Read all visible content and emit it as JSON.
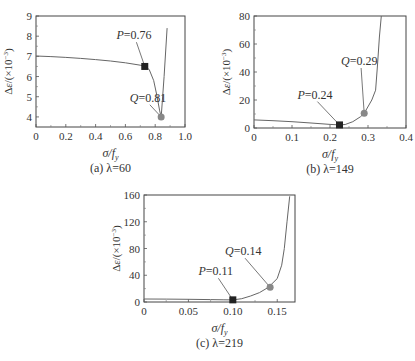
{
  "figure": {
    "panels": [
      "a",
      "b",
      "c"
    ]
  },
  "chart_data": [
    {
      "id": "a",
      "type": "line",
      "caption": "(a) λ=60",
      "xlabel": "σ/f_y",
      "ylabel": "Δε/(×10⁻³)",
      "xlim": [
        0,
        1.0
      ],
      "ylim": [
        3.5,
        9
      ],
      "xticks": [
        0,
        0.2,
        0.4,
        0.6,
        0.8,
        1.0
      ],
      "xticklabels": [
        "0",
        "0.2",
        "0.4",
        "0.6",
        "0.8",
        "1.0"
      ],
      "yticks": [
        4,
        5,
        6,
        7,
        8,
        9
      ],
      "yticklabels": [
        "4",
        "5",
        "6",
        "7",
        "8",
        "9"
      ],
      "grid": false,
      "frame": {
        "left": 36,
        "top": 16,
        "right": 185,
        "bottom": 127
      },
      "series": [
        {
          "name": "curve",
          "x": [
            0,
            0.1,
            0.2,
            0.3,
            0.4,
            0.5,
            0.6,
            0.7,
            0.73,
            0.76,
            0.79,
            0.81,
            0.83,
            0.84,
            0.86,
            0.88
          ],
          "y": [
            7.02,
            6.99,
            6.95,
            6.9,
            6.84,
            6.77,
            6.68,
            6.56,
            6.5,
            6.35,
            5.8,
            5.1,
            4.3,
            4.0,
            6.0,
            8.4
          ]
        }
      ],
      "markers": [
        {
          "label": "P=0.76",
          "prefix": "P",
          "value": "=0.76",
          "x": 0.73,
          "y": 6.5,
          "shape": "square",
          "color": "#222222",
          "label_x": 0.58,
          "label_y": 7.85
        },
        {
          "label": "Q=0.81",
          "prefix": "Q",
          "value": "=0.81",
          "x": 0.84,
          "y": 4.0,
          "shape": "circle",
          "color": "#888888",
          "label_x": 0.67,
          "label_y": 4.75
        }
      ]
    },
    {
      "id": "b",
      "type": "line",
      "caption": "(b) λ=149",
      "xlabel": "σ/f_y",
      "ylabel": "Δε/(×10⁻³)",
      "xlim": [
        0,
        0.4
      ],
      "ylim": [
        0,
        80
      ],
      "xticks": [
        0,
        0.1,
        0.2,
        0.3,
        0.4
      ],
      "xticklabels": [
        "0",
        "0.1",
        "0.2",
        "0.3",
        "0.4"
      ],
      "yticks": [
        0,
        20,
        40,
        60,
        80
      ],
      "yticklabels": [
        "0",
        "20",
        "40",
        "60",
        "80"
      ],
      "grid": false,
      "frame": {
        "left": 254,
        "top": 16,
        "right": 406,
        "bottom": 128
      },
      "series": [
        {
          "name": "curve",
          "x": [
            0,
            0.05,
            0.1,
            0.15,
            0.2,
            0.225,
            0.24,
            0.26,
            0.28,
            0.29,
            0.31,
            0.32,
            0.325,
            0.33,
            0.335
          ],
          "y": [
            5.8,
            5.2,
            4.5,
            3.6,
            2.6,
            2.2,
            2.5,
            4.5,
            8.0,
            10.5,
            20,
            27,
            45,
            65,
            80
          ]
        }
      ],
      "markers": [
        {
          "label": "P=0.24",
          "prefix": "P",
          "value": "=0.24",
          "x": 0.225,
          "y": 2.2,
          "shape": "square",
          "color": "#222222",
          "label_x": 0.13,
          "label_y": 21
        },
        {
          "label": "Q=0.29",
          "prefix": "Q",
          "value": "=0.29",
          "x": 0.29,
          "y": 10.5,
          "shape": "circle",
          "color": "#888888",
          "label_x": 0.245,
          "label_y": 45
        }
      ]
    },
    {
      "id": "c",
      "type": "line",
      "caption": "(c) λ=219",
      "xlabel": "σ/f_y",
      "ylabel": "Δε/(×10⁻³)",
      "xlim": [
        0,
        0.17
      ],
      "ylim": [
        0,
        160
      ],
      "xticks": [
        0,
        0.05,
        0.1,
        0.15
      ],
      "xticklabels": [
        "0",
        "0.05",
        "0.10",
        "0.15"
      ],
      "yticks": [
        0,
        40,
        80,
        120,
        160
      ],
      "yticklabels": [
        "0",
        "40",
        "80",
        "120",
        "160"
      ],
      "grid": false,
      "frame": {
        "left": 144,
        "top": 195,
        "right": 295,
        "bottom": 302
      },
      "series": [
        {
          "name": "curve",
          "x": [
            0,
            0.025,
            0.05,
            0.075,
            0.09,
            0.1,
            0.11,
            0.12,
            0.13,
            0.14,
            0.15,
            0.155,
            0.158,
            0.161,
            0.164
          ],
          "y": [
            4.5,
            4.3,
            4.0,
            3.6,
            3.3,
            3.2,
            5,
            9,
            14,
            22,
            35,
            55,
            80,
            120,
            158
          ]
        }
      ],
      "markers": [
        {
          "label": "P=0.11",
          "prefix": "P",
          "value": "=0.11",
          "x": 0.1,
          "y": 3.2,
          "shape": "square",
          "color": "#222222",
          "label_x": 0.068,
          "label_y": 40
        },
        {
          "label": "Q=0.14",
          "prefix": "Q",
          "value": "=0.14",
          "x": 0.142,
          "y": 22,
          "shape": "circle",
          "color": "#888888",
          "label_x": 0.098,
          "label_y": 70
        }
      ]
    }
  ]
}
